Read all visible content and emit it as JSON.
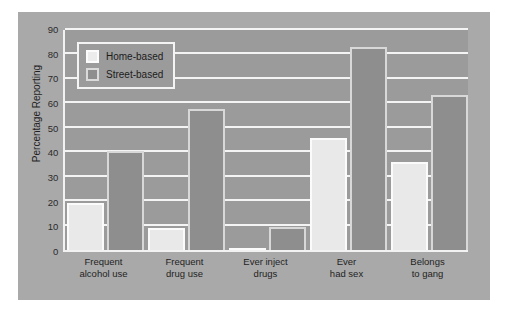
{
  "chart_data": {
    "type": "bar",
    "title": "",
    "xlabel": "",
    "ylabel": "Percentage Reporting",
    "ylim": [
      0,
      90
    ],
    "yticks": [
      0,
      10,
      20,
      30,
      40,
      50,
      60,
      70,
      80,
      90
    ],
    "grid": true,
    "legend_position": "top-left-inside",
    "categories": [
      "Frequent alcohol use",
      "Frequent drug use",
      "Ever inject drugs",
      "Ever had sex",
      "Belongs to gang"
    ],
    "category_lines": [
      [
        "Frequent",
        "alcohol use"
      ],
      [
        "Frequent",
        "drug use"
      ],
      [
        "Ever inject",
        "drugs"
      ],
      [
        "Ever",
        "had sex"
      ],
      [
        "Belongs",
        "to gang"
      ]
    ],
    "series": [
      {
        "name": "Home-based",
        "color": "#e9e9e9",
        "values": [
          19,
          9,
          1,
          45.5,
          35.5
        ]
      },
      {
        "name": "Street-based",
        "color": "#8e8e8e",
        "values": [
          40,
          57,
          9.5,
          82.5,
          63
        ]
      }
    ]
  },
  "figure": {
    "panel_color": "#a9a9a9",
    "plot_color": "#9b9b9b",
    "gridline_color": "#f4f4f4",
    "axis_color": "#f2f2f2"
  }
}
